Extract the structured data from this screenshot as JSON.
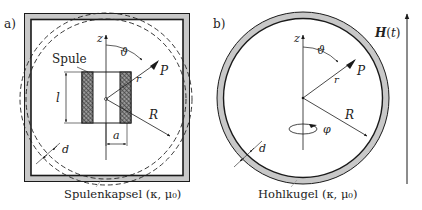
{
  "panel_a": {
    "tag": "a)",
    "coil_label": "Spule",
    "caption": "Spulenkapsel (κ, μ₀)",
    "axis_label": "z",
    "angle_label": "ϑ",
    "point_label": "P",
    "radius_vector_label": "r",
    "sphere_radius_label": "R",
    "coil_length_label": "l",
    "coil_radius_label": "a",
    "thickness_label": "d"
  },
  "panel_b": {
    "tag": "b)",
    "caption": "Hohlkugel (κ, μ₀)",
    "axis_label": "z",
    "angle_label": "ϑ",
    "point_label": "P",
    "radius_vector_label": "r",
    "sphere_radius_label": "R",
    "azimuth_label": "φ",
    "thickness_label": "d"
  },
  "field": {
    "label": "H(t)"
  },
  "colors": {
    "shell_fill": "#c8c8c8",
    "line": "#1a1a1a",
    "hatch": "#555555"
  }
}
